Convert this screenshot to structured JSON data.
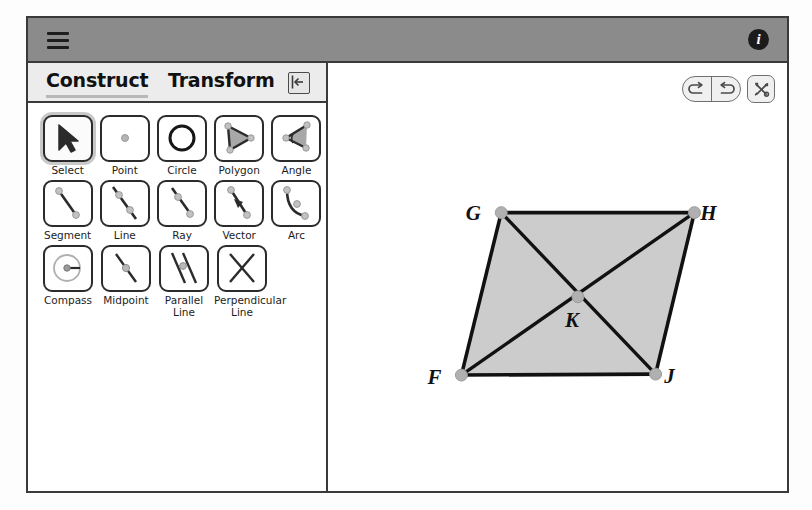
{
  "titlebar": {
    "menu_icon": "hamburger-menu-icon",
    "info_icon": "info-icon",
    "info_label": "i"
  },
  "sidebar": {
    "tabs": [
      {
        "label": "Construct",
        "active": true
      },
      {
        "label": "Transform",
        "active": false
      }
    ],
    "collapse_icon": "collapse-panel-left-icon",
    "tool_rows": [
      [
        {
          "label": "Select",
          "icon": "arrow-cursor-icon",
          "active": true
        },
        {
          "label": "Point",
          "icon": "point-icon",
          "active": false
        },
        {
          "label": "Circle",
          "icon": "circle-icon",
          "active": false
        },
        {
          "label": "Polygon",
          "icon": "polygon-icon",
          "active": false
        },
        {
          "label": "Angle",
          "icon": "angle-icon",
          "active": false
        }
      ],
      [
        {
          "label": "Segment",
          "icon": "segment-icon",
          "active": false
        },
        {
          "label": "Line",
          "icon": "line-icon",
          "active": false
        },
        {
          "label": "Ray",
          "icon": "ray-icon",
          "active": false
        },
        {
          "label": "Vector",
          "icon": "vector-icon",
          "active": false
        },
        {
          "label": "Arc",
          "icon": "arc-icon",
          "active": false
        }
      ],
      [
        {
          "label": "Compass",
          "icon": "compass-icon",
          "active": false
        },
        {
          "label": "Midpoint",
          "icon": "midpoint-icon",
          "active": false
        },
        {
          "label": "Parallel\nLine",
          "icon": "parallel-line-icon",
          "active": false
        },
        {
          "label": "Perpendicular\nLine",
          "icon": "perpendicular-line-icon",
          "active": false
        }
      ]
    ]
  },
  "canvas": {
    "undo_icon": "undo-arrow-icon",
    "redo_icon": "redo-arrow-icon",
    "settings_icon": "tools-wrench-screwdriver-icon"
  },
  "chart_data": {
    "type": "diagram",
    "shape": "parallelogram",
    "fill_color": "#cccccc",
    "stroke_color": "#111111",
    "vertex_color": "#b0b0b0",
    "points": [
      {
        "name": "G",
        "x": 474,
        "y": 196,
        "label_dx": -28,
        "label_dy": 7
      },
      {
        "name": "H",
        "x": 668,
        "y": 196,
        "label_dx": 14,
        "label_dy": 7
      },
      {
        "name": "J",
        "x": 629,
        "y": 359,
        "label_dx": 14,
        "label_dy": 9
      },
      {
        "name": "F",
        "x": 434,
        "y": 360,
        "label_dx": -27,
        "label_dy": 9
      },
      {
        "name": "K",
        "x": 551,
        "y": 281,
        "label_dx": -6,
        "label_dy": 30
      }
    ],
    "edges": [
      [
        "G",
        "H"
      ],
      [
        "H",
        "J"
      ],
      [
        "J",
        "F"
      ],
      [
        "F",
        "G"
      ]
    ],
    "diagonals": [
      [
        "F",
        "H"
      ],
      [
        "G",
        "J"
      ]
    ]
  }
}
